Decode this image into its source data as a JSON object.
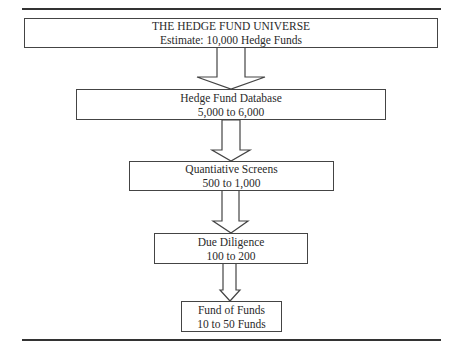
{
  "diagram": {
    "type": "funnel-flowchart",
    "stages": [
      {
        "title": "THE HEDGE FUND UNIVERSE",
        "subtitle": "Estimate: 10,000 Hedge Funds"
      },
      {
        "title": "Hedge Fund Database",
        "subtitle": "5,000 to 6,000"
      },
      {
        "title": "Quantiative Screens",
        "subtitle": "500 to 1,000"
      },
      {
        "title": "Due Diligence",
        "subtitle": "100 to 200"
      },
      {
        "title": "Fund of Funds",
        "subtitle": "10 to 50 Funds"
      }
    ],
    "connectors": [
      {
        "from": 0,
        "to": 1,
        "type": "block-arrow-down"
      },
      {
        "from": 1,
        "to": 2,
        "type": "block-arrow-down"
      },
      {
        "from": 2,
        "to": 3,
        "type": "block-arrow-down"
      },
      {
        "from": 3,
        "to": 4,
        "type": "block-arrow-down"
      }
    ],
    "colors": {
      "line": "#444444",
      "text": "#2a2a2a",
      "background": "#ffffff"
    }
  }
}
